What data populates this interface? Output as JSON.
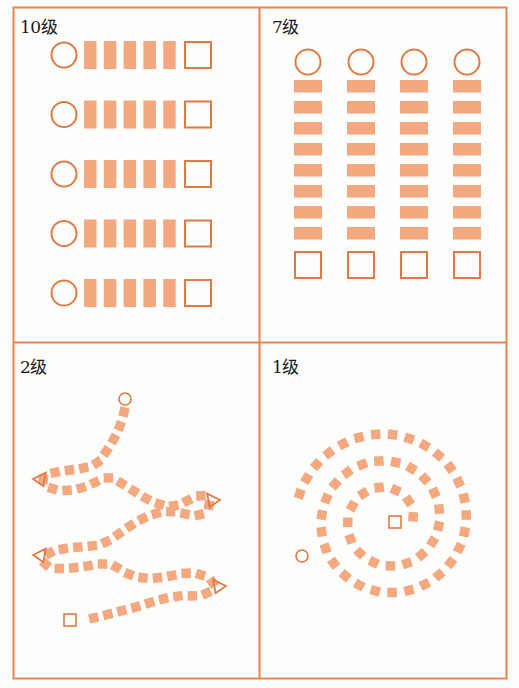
{
  "colors": {
    "frame": "#e9844f",
    "outline": "#e07a45",
    "fill": "#f4a87f",
    "background": "#fdfdfb",
    "label": "#1a1a1a"
  },
  "panels": [
    {
      "id": "level-10",
      "label": "10级",
      "description": "5 rows: circle, 5 vertical bars, square",
      "rows": 5,
      "bars_per_row": 5
    },
    {
      "id": "level-7",
      "label": "7级",
      "description": "4 columns: circle, 8 horizontal bars, square",
      "columns": 4,
      "bars_per_column": 8
    },
    {
      "id": "level-2",
      "label": "2级",
      "description": "Winding dashed path from circle through triangles to square"
    },
    {
      "id": "level-1",
      "label": "1级",
      "description": "Dashed spiral from outer circle inward to center square"
    }
  ]
}
